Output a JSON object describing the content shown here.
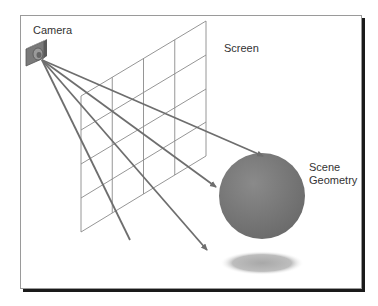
{
  "diagram": {
    "labels": {
      "camera": "Camera",
      "screen": "Screen",
      "scene_line1": "Scene",
      "scene_line2": "Geometry"
    },
    "colors": {
      "frame_border": "#9a9a9a",
      "frame_shadow": "#1a1a1a",
      "grid": "#8a8a8a",
      "ray": "#6e6e6e",
      "sphere": "#777777",
      "shadow": "#b5b5b5",
      "camera_body": "#7a7a7a"
    },
    "grid": {
      "columns": 4,
      "rows": 4
    },
    "rays": 4
  }
}
